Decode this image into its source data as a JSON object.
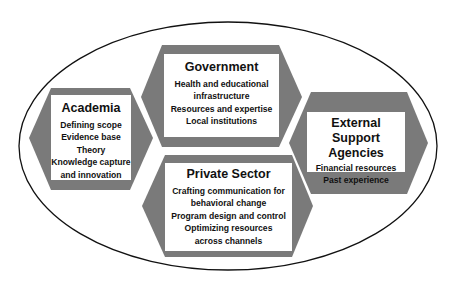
{
  "diagram": {
    "container": "ellipse",
    "colors": {
      "hexagon_fill": "#7a7a7a",
      "box_fill": "#ffffff",
      "outline": "#111111",
      "text": "#111111"
    },
    "nodes": [
      {
        "id": "academia",
        "title": "Academia",
        "items": [
          "Defining scope",
          "Evidence base",
          "Theory",
          "Knowledge capture",
          "and innovation"
        ]
      },
      {
        "id": "government",
        "title": "Government",
        "items": [
          "Health and educational",
          "infrastructure",
          "Resources and expertise",
          "Local institutions"
        ]
      },
      {
        "id": "private_sector",
        "title": "Private Sector",
        "items": [
          "Crafting communication for",
          "behavioral change",
          "Program design and control",
          "Optimizing resources",
          "across channels"
        ]
      },
      {
        "id": "external_support",
        "title_lines": [
          "External Support",
          "Agencies"
        ],
        "items": [
          "Financial resources",
          "Past experience"
        ]
      }
    ]
  }
}
